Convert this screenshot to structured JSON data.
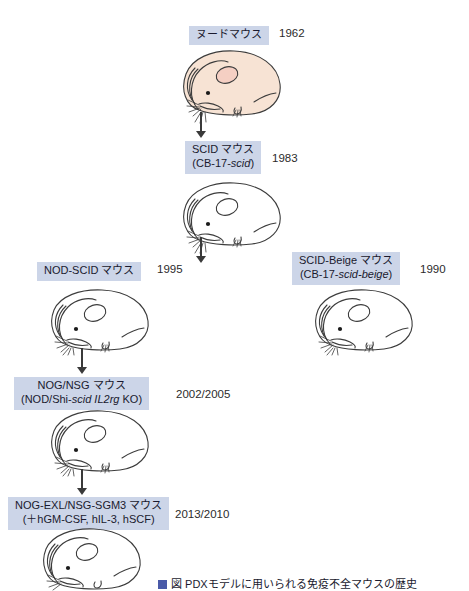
{
  "figure": {
    "title_caption": "図  PDXモデルに用いられる免疫不全マウスの歴史",
    "caption_marker": "fig-marker"
  },
  "nodes": [
    {
      "id": "nude",
      "name_line1": "ヌードマウス",
      "name_line2": "",
      "year": "1962",
      "mouse_fill": "#f7e3d4",
      "mouse_label": "nude-mouse-illustration"
    },
    {
      "id": "scid",
      "name_line1": "SCID マウス",
      "name_line2": "(CB-17-scid)",
      "year": "1983",
      "mouse_fill": "#ffffff",
      "mouse_label": "scid-mouse-illustration"
    },
    {
      "id": "nod-scid",
      "name_line1": "NOD-SCID マウス",
      "name_line2": "",
      "year": "1995",
      "mouse_fill": "#ffffff",
      "mouse_label": "nod-scid-mouse-illustration"
    },
    {
      "id": "scid-beige",
      "name_line1": "SCID-Beige マウス",
      "name_line2": "(CB-17-scid-beige)",
      "year": "1990",
      "mouse_fill": "#ffffff",
      "mouse_label": "scid-beige-mouse-illustration"
    },
    {
      "id": "nog-nsg",
      "name_line1": "NOG/NSG マウス",
      "name_line2": "(NOD/Shi-scid IL2rg KO)",
      "year": "2002/2005",
      "mouse_fill": "#ffffff",
      "mouse_label": "nog-nsg-mouse-illustration"
    },
    {
      "id": "nog-exl",
      "name_line1": "NOG-EXL/NSG-SGM3 マウス",
      "name_line2": "(＋hGM-CSF, hIL-3, hSCF)",
      "year": "2013/2010",
      "mouse_fill": "#ffffff",
      "mouse_label": "nog-exl-mouse-illustration"
    }
  ],
  "labels": {
    "nude_full": "ヌードマウス",
    "scid_l1": "SCID マウス",
    "scid_l2_pre": "(CB-17-",
    "scid_l2_em": "scid",
    "scid_l2_post": ")",
    "nodscid_full": "NOD-SCID マウス",
    "beige_l1": "SCID-Beige マウス",
    "beige_l2_pre": "(CB-17-",
    "beige_l2_em": "scid-beige",
    "beige_l2_post": ")",
    "nog_l1": "NOG/NSG マウス",
    "nog_l2_pre": "(NOD/Shi-",
    "nog_l2_em": "scid IL2rg",
    "nog_l2_post": " KO)",
    "exl_l1": "NOG-EXL/NSG-SGM3 マウス",
    "exl_l2": "(＋hGM-CSF, hIL-3, hSCF)"
  },
  "years": {
    "nude": "1962",
    "scid": "1983",
    "nodscid": "1995",
    "beige": "1990",
    "nog": "2002/2005",
    "exl": "2013/2010"
  },
  "colors": {
    "label_bg": "#ccd5e8",
    "arrow": "#3a3a3a",
    "nude_body": "#f7e3d4",
    "outline": "#3c3c3c"
  }
}
